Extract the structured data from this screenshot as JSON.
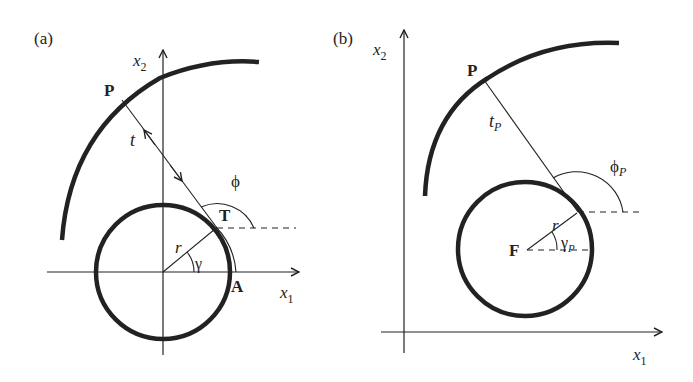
{
  "figure": {
    "colors": {
      "ink": "#222222",
      "background": "#ffffff"
    },
    "panels": [
      {
        "id": "a",
        "label": "(a)",
        "axes": {
          "x_label": "x",
          "x_sub": "1",
          "y_label": "x",
          "y_sub": "2"
        },
        "points": {
          "P": "P",
          "T": "T",
          "A": "A"
        },
        "labels": {
          "t": "t",
          "r": "r",
          "phi": "ϕ",
          "gamma": "γ"
        }
      },
      {
        "id": "b",
        "label": "(b)",
        "axes": {
          "x_label": "x",
          "x_sub": "1",
          "y_label": "x",
          "y_sub": "2"
        },
        "points": {
          "P": "P",
          "F": "F"
        },
        "labels": {
          "t": "t",
          "t_sub": "P",
          "r": "r",
          "phi": "ϕ",
          "phi_sub": "P",
          "gamma": "γ",
          "gamma_sub": "P"
        }
      }
    ]
  }
}
